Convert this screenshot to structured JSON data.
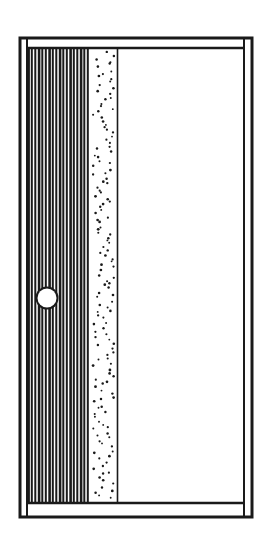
{
  "figure": {
    "canvas": {
      "width": 267,
      "height": 543,
      "background": "#ffffff"
    },
    "ink": "#1a1a1a",
    "outer_frame": {
      "x": 20,
      "y": 38,
      "w": 232,
      "h": 479,
      "stroke": 3
    },
    "top_bar": {
      "y1": 38,
      "y2": 48
    },
    "bottom_bar": {
      "y1": 503,
      "y2": 517
    },
    "inner_side_rails": {
      "left_x": 27,
      "right_x": 244
    },
    "striped_panel": {
      "x": 27,
      "y": 48,
      "w": 63,
      "h": 455,
      "stripe_count": 18,
      "stripe_width": 2
    },
    "stippled_panel": {
      "x": 90,
      "y": 48,
      "w": 27,
      "h": 455,
      "dot_count": 150,
      "dot_radius": 0.9
    },
    "divider_line": {
      "x": 117.5
    },
    "empty_panel": {
      "x": 118,
      "y": 48,
      "w": 126,
      "h": 455
    },
    "knob": {
      "cx": 47,
      "cy": 298,
      "r": 10,
      "fill": "#ffffff"
    }
  }
}
